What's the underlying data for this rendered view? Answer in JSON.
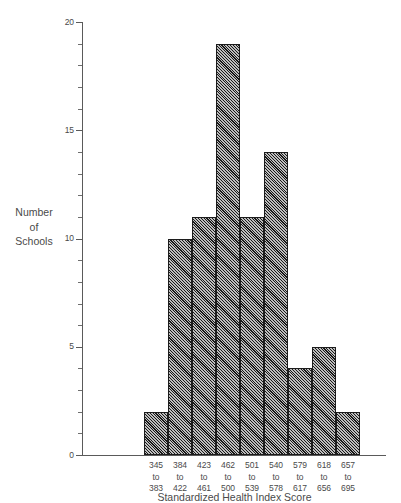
{
  "chart_data": {
    "type": "bar",
    "title": "",
    "xlabel": "Standardized Health Index Score",
    "ylabel": "Number of Schools",
    "ylim": [
      0,
      20
    ],
    "ytick_labels": [
      "0",
      "5",
      "10",
      "15",
      "20"
    ],
    "ytick_values": [
      0,
      5,
      10,
      15,
      20
    ],
    "minor_tick_step": 1,
    "grid": false,
    "legend": null,
    "categories": [
      "345 to 383",
      "384 to 422",
      "423 to 461",
      "462 to 500",
      "501 to 539",
      "540 to 578",
      "579 to 617",
      "618 to 656",
      "657 to 695"
    ],
    "category_lines": [
      [
        "345",
        "to",
        "383"
      ],
      [
        "384",
        "to",
        "422"
      ],
      [
        "423",
        "to",
        "461"
      ],
      [
        "462",
        "to",
        "500"
      ],
      [
        "501",
        "to",
        "539"
      ],
      [
        "540",
        "to",
        "578"
      ],
      [
        "579",
        "to",
        "617"
      ],
      [
        "618",
        "to",
        "656"
      ],
      [
        "657",
        "to",
        "695"
      ]
    ],
    "values": [
      2,
      10,
      11,
      19,
      11,
      14,
      4,
      5,
      2
    ],
    "bar_fill": "#6d6d6d",
    "bar_edge": "#1c1c1c",
    "axis_color": "#5a5a5a"
  },
  "y_axis_title_lines": [
    "Number",
    "of",
    "Schools"
  ]
}
